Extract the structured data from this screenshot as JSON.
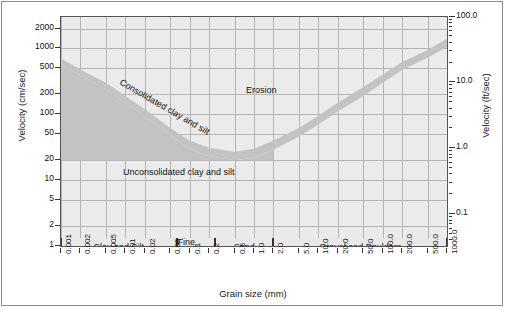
{
  "chart_data": {
    "type": "area",
    "title": "",
    "xlabel": "Grain size (mm)",
    "ylabel": "Velocity (cm/sec)",
    "ylabel_right": "Velocity (ft/sec)",
    "xscale": "log",
    "yscale": "log",
    "xlim": [
      0.001,
      1000.0
    ],
    "ylim": [
      1,
      3000
    ],
    "ylim_right": [
      0.0328,
      98.4
    ],
    "grid": true,
    "legend": false,
    "xticks": [
      "0.001",
      "0.002",
      "0.005",
      "0.01",
      "0.02",
      "0.05",
      "0.1",
      "0.2",
      "0.5",
      "1.0",
      "2.0",
      "5.0",
      "10.0",
      "20.0",
      "50.0",
      "100.0",
      "200.0",
      "500.0",
      "1000.0"
    ],
    "xtick_values": [
      0.001,
      0.002,
      0.005,
      0.01,
      0.02,
      0.05,
      0.1,
      0.2,
      0.5,
      1.0,
      2.0,
      5.0,
      10.0,
      20.0,
      50.0,
      100.0,
      200.0,
      500.0,
      1000.0
    ],
    "yticks": [
      "2000",
      "1000",
      "500",
      "200",
      "100",
      "50",
      "20",
      "10",
      "5",
      "2",
      "1"
    ],
    "ytick_values": [
      2000,
      1000,
      500,
      200,
      100,
      50,
      20,
      10,
      5,
      2,
      1
    ],
    "yticks_right": [
      "100.0",
      "10.0",
      "1.0",
      "0.1"
    ],
    "ytick_right_values": [
      100.0,
      10.0,
      1.0,
      0.1
    ],
    "annotations": [
      {
        "name": "consolidated-label",
        "text": "Consolidated clay and silt",
        "rotated": true
      },
      {
        "name": "unconsolidated-label",
        "text": "Unconsolidated clay and silt",
        "rotated": false
      },
      {
        "name": "erosion-label",
        "text": "Erosion",
        "rotated": false
      }
    ],
    "series": [
      {
        "name": "critical erosion velocity band (upper)",
        "x": [
          0.001,
          0.002,
          0.005,
          0.01,
          0.02,
          0.05,
          0.1,
          0.2,
          0.5,
          1.0,
          2.0,
          5.0,
          10.0,
          20.0,
          50.0,
          100.0,
          200.0,
          500.0,
          1000.0
        ],
        "values": [
          700,
          480,
          300,
          190,
          120,
          62,
          40,
          31,
          27,
          30,
          40,
          62,
          95,
          150,
          260,
          400,
          620,
          950,
          1400
        ]
      },
      {
        "name": "critical erosion velocity band (lower)",
        "x": [
          0.001,
          0.002,
          0.005,
          0.01,
          0.02,
          0.05,
          0.1,
          0.2,
          0.5,
          1.0,
          2.0,
          5.0,
          10.0,
          20.0,
          50.0,
          100.0,
          200.0,
          500.0,
          1000.0
        ],
        "values": [
          560,
          390,
          240,
          150,
          95,
          48,
          30,
          23,
          20,
          22,
          29,
          46,
          70,
          110,
          190,
          300,
          470,
          720,
          1050
        ]
      }
    ],
    "categories": [
      {
        "label": "Clay and Silt",
        "x_start": 0.001,
        "x_end": 0.0625
      },
      {
        "label": "Fine Sand",
        "x_start": 0.0625,
        "x_end": 0.25
      },
      {
        "label": "Sand",
        "x_start": 0.25,
        "x_end": 2.0
      },
      {
        "label": "Gravel and Boulders",
        "x_start": 2.0,
        "x_end": 1000.0
      }
    ],
    "colors": {
      "plot_background": "#ebebeb",
      "band_fill": "#c3c3c3",
      "grid": "#b4b4b4",
      "axis": "#555555",
      "text": "#1a1a1a"
    }
  }
}
